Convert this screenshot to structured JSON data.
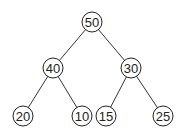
{
  "diagram": {
    "type": "binary-tree",
    "nodes": [
      {
        "id": "n50",
        "label": "50",
        "x": 92,
        "y": 22
      },
      {
        "id": "n40",
        "label": "40",
        "x": 53,
        "y": 68
      },
      {
        "id": "n30",
        "label": "30",
        "x": 131,
        "y": 68
      },
      {
        "id": "n20",
        "label": "20",
        "x": 23,
        "y": 116
      },
      {
        "id": "n10",
        "label": "10",
        "x": 82,
        "y": 116
      },
      {
        "id": "n15",
        "label": "15",
        "x": 106,
        "y": 116
      },
      {
        "id": "n25",
        "label": "25",
        "x": 163,
        "y": 116
      }
    ],
    "edges": [
      {
        "from": "n50",
        "to": "n40"
      },
      {
        "from": "n50",
        "to": "n30"
      },
      {
        "from": "n40",
        "to": "n20"
      },
      {
        "from": "n40",
        "to": "n10"
      },
      {
        "from": "n30",
        "to": "n15"
      },
      {
        "from": "n30",
        "to": "n25"
      }
    ],
    "node_radius": 10
  }
}
